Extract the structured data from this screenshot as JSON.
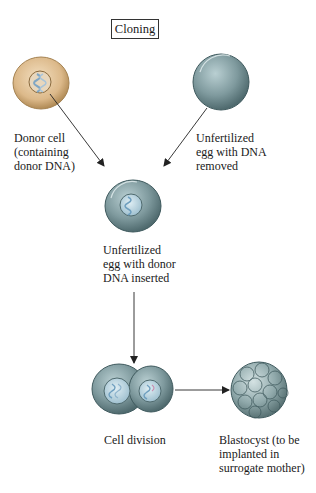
{
  "title": "Cloning",
  "nodes": {
    "donor_cell": {
      "label": "Donor cell\n(containing\ndonor DNA)"
    },
    "unfertilized_egg": {
      "label": "Unfertilized\negg with DNA\nremoved"
    },
    "egg_with_donor_dna": {
      "label": "Unfertilized\negg with donor\nDNA inserted"
    },
    "cell_division": {
      "label": "Cell division"
    },
    "blastocyst": {
      "label": "Blastocyst (to be\nimplanted in\nsurrogate mother)"
    }
  },
  "edges": [
    {
      "from": "donor_cell",
      "to": "egg_with_donor_dna"
    },
    {
      "from": "unfertilized_egg",
      "to": "egg_with_donor_dna"
    },
    {
      "from": "egg_with_donor_dna",
      "to": "cell_division"
    },
    {
      "from": "cell_division",
      "to": "blastocyst"
    }
  ],
  "colors": {
    "donor_cell_fill": "#d9b88a",
    "egg_fill": "#7f9a9e",
    "nucleus_fill": "#b8d3df",
    "dna_strand": "#6f9fbf",
    "arrow": "#222222"
  }
}
